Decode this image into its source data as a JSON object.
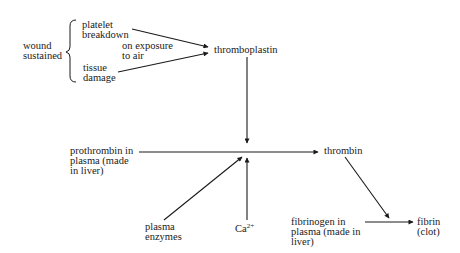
{
  "diagram": {
    "nodes": {
      "wound": "wound\nsustained",
      "platelet": "platelet\nbreakdown",
      "exposure": "on exposure\nto air",
      "tissue": "tissue\ndamage",
      "thromboplastin": "thromboplastin",
      "prothrombin": "prothrombin in\nplasma (made\nin liver)",
      "thrombin": "thrombin",
      "plasma_enzymes": "plasma\nenzymes",
      "calcium_base": "Ca",
      "calcium_sup": "2+",
      "fibrinogen": "fibrinogen in\nplasma (made in\nliver)",
      "fibrin": "fibrin\n(clot)"
    },
    "edges": [
      {
        "from": "platelet",
        "to": "thromboplastin"
      },
      {
        "from": "tissue",
        "to": "thromboplastin"
      },
      {
        "from": "thromboplastin",
        "to": "reaction-point"
      },
      {
        "from": "prothrombin",
        "to": "thrombin"
      },
      {
        "from": "plasma_enzymes",
        "to": "reaction-point"
      },
      {
        "from": "calcium",
        "to": "reaction-point"
      },
      {
        "from": "thrombin",
        "to": "fibrin"
      },
      {
        "from": "fibrinogen",
        "to": "fibrin"
      }
    ],
    "colors": {
      "ink": "#1a1a1a",
      "background": "#ffffff"
    }
  }
}
